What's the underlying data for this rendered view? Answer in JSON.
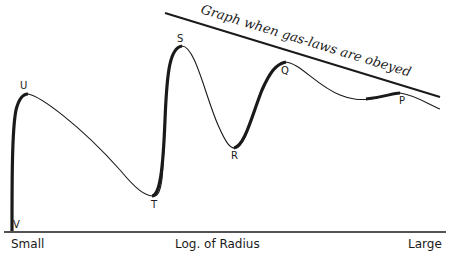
{
  "diagram": {
    "title_line_label": "Graph when gas-laws are obeyed",
    "x_axis": {
      "left": "Small",
      "center": "Log. of Radius",
      "right": "Large"
    },
    "points": {
      "V": "V",
      "U": "U",
      "T": "T",
      "S": "S",
      "R": "R",
      "Q": "Q",
      "P": "P"
    },
    "colors": {
      "ink": "#1a1a1a",
      "background": "#ffffff"
    }
  }
}
